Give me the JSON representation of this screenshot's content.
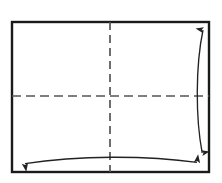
{
  "canvas": {
    "width": 222,
    "height": 183,
    "background": "#ffffff"
  },
  "diagram": {
    "title": "Rectangular sheet with centre fold lines and dimension arrows",
    "type": "folding-diagram",
    "shape_name": "rectangle-sheet",
    "colors": {
      "outline": "#1a1a1a",
      "fold_line": "#555555",
      "arrow": "#222222",
      "fill": "#ffffff"
    },
    "sheet": {
      "name": "paper-sheet",
      "x": 12,
      "y": 22,
      "width": 197,
      "height": 150,
      "stroke_width": 2.4
    },
    "fold_lines": [
      {
        "name": "vertical-centre-fold",
        "orientation": "vertical",
        "x": 110,
        "y1": 22,
        "y2": 172,
        "style": "dashed",
        "dash": "8 5",
        "stroke_width": 1.6
      },
      {
        "name": "horizontal-centre-fold",
        "orientation": "horizontal",
        "y": 96,
        "x1": 12,
        "x2": 209,
        "style": "dashed",
        "dash": "9 5",
        "stroke_width": 1.6
      }
    ],
    "arrows": [
      {
        "name": "height-dimension-arrow",
        "orientation": "vertical",
        "double_headed": true,
        "curved": true,
        "path": "M 203 27 C 195 65, 195 118, 202.5 156",
        "head_start": {
          "x": 203,
          "y": 27,
          "direction": "up"
        },
        "head_end": {
          "x": 202.5,
          "y": 156,
          "direction": "down"
        },
        "stroke_width": 1.3
      },
      {
        "name": "width-dimension-arrow",
        "orientation": "horizontal",
        "double_headed": true,
        "curved": true,
        "path": "M 22 164 C 75 155, 148 155, 200 163",
        "head_start": {
          "x": 22,
          "y": 164,
          "direction": "left"
        },
        "head_end": {
          "x": 200,
          "y": 163,
          "direction": "right"
        },
        "stroke_width": 1.3
      }
    ]
  },
  "labels": {
    "none": ""
  }
}
